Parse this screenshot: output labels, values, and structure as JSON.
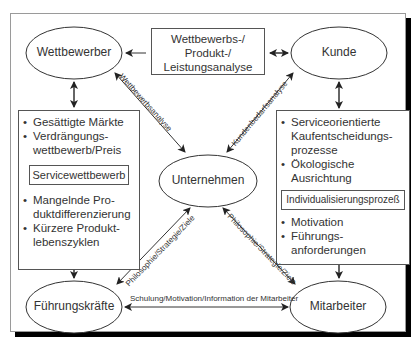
{
  "diagram": {
    "nodes": {
      "wettbewerber": "Wettbewerber",
      "kunde": "Kunde",
      "unternehmen": "Unternehmen",
      "fuehrungskraefte": "Führungskräfte",
      "mitarbeiter": "Mitarbeiter"
    },
    "analysis_box": {
      "line1": "Wettbewerbs-/",
      "line2": "Produkt-/",
      "line3": "Leistungsanalyse"
    },
    "left_box": {
      "items_top": [
        "Gesättigte Märkte",
        "Verdrängungs-\nwettbewerb/Preis"
      ],
      "item_top_0": "Gesättigte Märkte",
      "item_top_1a": "Verdrängungs-",
      "item_top_1b": "wettbewerb/Preis",
      "inner_label": "Servicewettbewerb",
      "item_bottom_0a": "Mangelnde Pro-",
      "item_bottom_0b": "duktdifferenzierung",
      "item_bottom_1a": "Kürzere Produkt-",
      "item_bottom_1b": "lebenszyklen"
    },
    "right_box": {
      "item_top_0a": "Serviceorientierte",
      "item_top_0b": "Kaufentscheidungs-",
      "item_top_0c": "prozesse",
      "item_top_1a": "Ökologische",
      "item_top_1b": "Ausrichtung",
      "inner_label": "Individualisierungsprozeß",
      "item_bottom_0": "Motivation",
      "item_bottom_1a": "Führungs-",
      "item_bottom_1b": "anforderungen"
    },
    "edge_labels": {
      "wettbewerber_unternehmen": "Wettbewerbsanalyse",
      "kunde_unternehmen": "Kundenbedarfsanalyse",
      "fuehrung_unternehmen": "Philosophie/Strategie/Ziele",
      "mitarbeiter_unternehmen": "Philosophie/Strategie/Ziele",
      "fuehrung_mitarbeiter": "Schulung/Motivation/Information der Mitarbeiter"
    },
    "colors": {
      "line": "#333333",
      "frame": "#9a9a9a",
      "shadow": "#000000"
    }
  }
}
